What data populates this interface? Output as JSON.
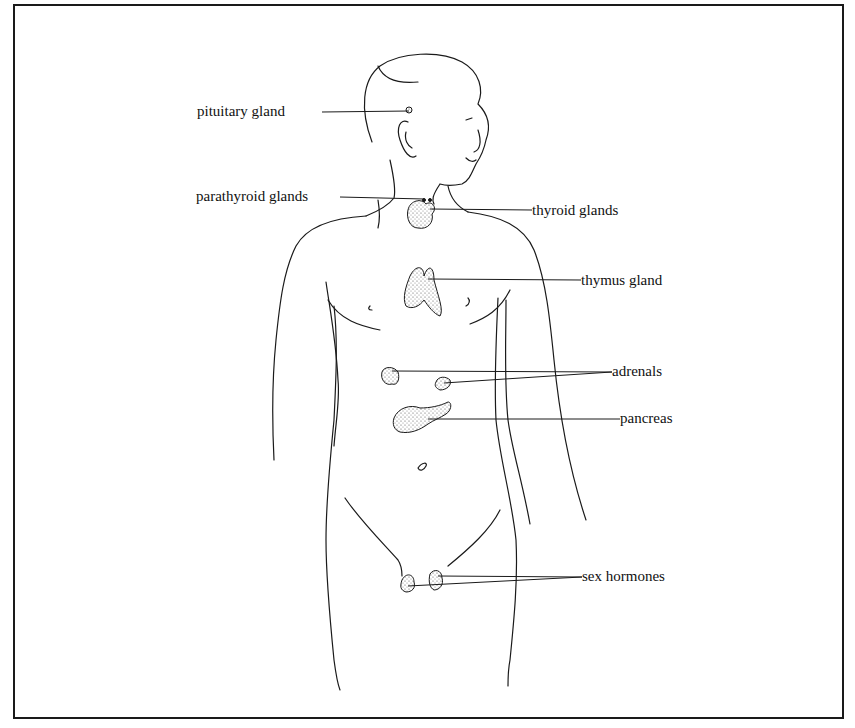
{
  "figure": {
    "labels": {
      "pituitary": "pituitary gland",
      "parathyroid": "parathyroid glands",
      "thyroid": "thyroid glands",
      "thymus": "thymus gland",
      "adrenals": "adrenals",
      "pancreas": "pancreas",
      "sex_hormones": "sex hormones"
    },
    "colors": {
      "line": "#1a1a1a",
      "stipple": "#555555",
      "background": "#ffffff"
    }
  }
}
